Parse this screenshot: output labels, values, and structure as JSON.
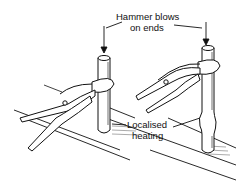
{
  "diagram": {
    "labels": {
      "hammer_line1": "Hammer blows",
      "hammer_line2": "on ends",
      "heating_line1": "Localised",
      "heating_line2": "heating"
    },
    "colors": {
      "ink": "#111111",
      "background": "#ffffff"
    }
  }
}
